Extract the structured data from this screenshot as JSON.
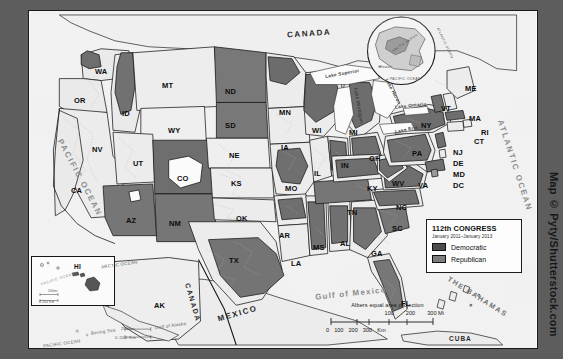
{
  "figure": {
    "watermark": "Map © Pyty/Shutterstock.com",
    "frame_color": "#5d5d5d",
    "background_color": "#fbfbfb"
  },
  "legend": {
    "title": "112th CONGRESS",
    "subtitle": "January 2011–January 2013",
    "entries": [
      {
        "label": "Democratic",
        "color": "#4c4c4c",
        "swatch_name": "democratic-swatch"
      },
      {
        "label": "Republican",
        "color": "#7d7d7d",
        "swatch_name": "republican-swatch"
      }
    ]
  },
  "scalebar": {
    "projection": "Albers equal area projection",
    "miles_ticks": [
      "100",
      "200",
      "300 Mi"
    ],
    "km_ticks": [
      "0",
      "100",
      "200",
      "300",
      "Km"
    ]
  },
  "insets": {
    "hawaii": {
      "state": "HI",
      "ocean": "PACIFIC OCEAN",
      "scale_mi": "200mi",
      "scale_km": "0   200 Km"
    },
    "globe": {
      "labels": [
        "ARCTIC OCEAN",
        "ATLANTIC OCEAN",
        "PACIFIC OCEAN",
        "Hawaii"
      ]
    },
    "alaska": {
      "state": "AK",
      "labels": [
        "ARCTIC OCEAN",
        "Bering Sea",
        "Gulf of Alaska",
        "PACIFIC OCEAN"
      ],
      "scale_mi": "200mi",
      "scale_km": "0   200 Km"
    }
  },
  "countries": [
    {
      "name": "CANADA",
      "x": 258,
      "y": 22
    },
    {
      "name": "MEXICO",
      "x": 196,
      "y": 302
    },
    {
      "name": "CANADA",
      "x": 150,
      "y": 300
    },
    {
      "name": "CUBA",
      "x": 425,
      "y": 330
    },
    {
      "name": "THE BAHAMAS",
      "x": 448,
      "y": 296
    }
  ],
  "oceans": [
    {
      "name": "PACIFIC OCEAN",
      "x": 20,
      "y": 175
    },
    {
      "name": "ATLANTIC OCEAN",
      "x": 452,
      "y": 165
    },
    {
      "name": "Gulf of Mexico",
      "x": 300,
      "y": 282
    }
  ],
  "lakes": [
    {
      "name": "Lake Superior",
      "x": 312,
      "y": 66
    },
    {
      "name": "Lake Michigan",
      "x": 330,
      "y": 108
    },
    {
      "name": "Lake Huron",
      "x": 358,
      "y": 90
    },
    {
      "name": "Lake Erie",
      "x": 376,
      "y": 120
    },
    {
      "name": "Lake Ontario",
      "x": 386,
      "y": 100
    }
  ],
  "chart_data": {
    "type": "map",
    "categories": [
      "Democratic",
      "Republican"
    ],
    "colors": {
      "Democratic": "#4c4c4c",
      "Republican": "#7d7d7d",
      "unshaded": "#e9e9e9"
    },
    "states": [
      {
        "code": "WA",
        "label_x": 66,
        "label_y": 56,
        "party": "mixed"
      },
      {
        "code": "OR",
        "label_x": 45,
        "label_y": 85,
        "party": "mixed"
      },
      {
        "code": "ID",
        "label_x": 93,
        "label_y": 98,
        "party": "Republican"
      },
      {
        "code": "MT",
        "label_x": 133,
        "label_y": 70,
        "party": "mixed"
      },
      {
        "code": "WY",
        "label_x": 139,
        "label_y": 115,
        "party": "mixed"
      },
      {
        "code": "ND",
        "label_x": 196,
        "label_y": 76,
        "party": "Republican"
      },
      {
        "code": "SD",
        "label_x": 196,
        "label_y": 110,
        "party": "Republican"
      },
      {
        "code": "NE",
        "label_x": 200,
        "label_y": 140,
        "party": "mixed"
      },
      {
        "code": "MN",
        "label_x": 250,
        "label_y": 97,
        "party": "mixed"
      },
      {
        "code": "IA",
        "label_x": 252,
        "label_y": 132,
        "party": "mixed"
      },
      {
        "code": "WI",
        "label_x": 283,
        "label_y": 115,
        "party": "mixed"
      },
      {
        "code": "MI",
        "label_x": 320,
        "label_y": 117,
        "party": "mixed"
      },
      {
        "code": "NV",
        "label_x": 63,
        "label_y": 134,
        "party": "mixed"
      },
      {
        "code": "UT",
        "label_x": 104,
        "label_y": 148,
        "party": "mixed"
      },
      {
        "code": "CO",
        "label_x": 148,
        "label_y": 163,
        "party": "Republican"
      },
      {
        "code": "KS",
        "label_x": 202,
        "label_y": 168,
        "party": "mixed"
      },
      {
        "code": "MO",
        "label_x": 256,
        "label_y": 173,
        "party": "mixed"
      },
      {
        "code": "IL",
        "label_x": 285,
        "label_y": 158,
        "party": "mixed"
      },
      {
        "code": "IN",
        "label_x": 312,
        "label_y": 150,
        "party": "mixed"
      },
      {
        "code": "OH",
        "label_x": 340,
        "label_y": 143,
        "party": "mixed"
      },
      {
        "code": "CA",
        "label_x": 42,
        "label_y": 175,
        "party": "mixed"
      },
      {
        "code": "AZ",
        "label_x": 97,
        "label_y": 205,
        "party": "Republican"
      },
      {
        "code": "NM",
        "label_x": 140,
        "label_y": 208,
        "party": "Republican"
      },
      {
        "code": "OK",
        "label_x": 207,
        "label_y": 203,
        "party": "mixed"
      },
      {
        "code": "AR",
        "label_x": 250,
        "label_y": 220,
        "party": "mixed"
      },
      {
        "code": "TX",
        "label_x": 200,
        "label_y": 245,
        "party": "mixed"
      },
      {
        "code": "LA",
        "label_x": 262,
        "label_y": 248,
        "party": "mixed"
      },
      {
        "code": "MS",
        "label_x": 284,
        "label_y": 232,
        "party": "mixed"
      },
      {
        "code": "AL",
        "label_x": 311,
        "label_y": 228,
        "party": "mixed"
      },
      {
        "code": "TN",
        "label_x": 318,
        "label_y": 197,
        "party": "Republican"
      },
      {
        "code": "KY",
        "label_x": 338,
        "label_y": 173,
        "party": "mixed"
      },
      {
        "code": "GA",
        "label_x": 342,
        "label_y": 238,
        "party": "mixed"
      },
      {
        "code": "FL",
        "label_x": 372,
        "label_y": 288,
        "party": "mixed"
      },
      {
        "code": "SC",
        "label_x": 363,
        "label_y": 213,
        "party": "Republican"
      },
      {
        "code": "NC",
        "label_x": 367,
        "label_y": 192,
        "party": "mixed"
      },
      {
        "code": "VA",
        "label_x": 389,
        "label_y": 170,
        "party": "mixed"
      },
      {
        "code": "WV",
        "label_x": 363,
        "label_y": 168,
        "party": "mixed"
      },
      {
        "code": "PA",
        "label_x": 383,
        "label_y": 138,
        "party": "mixed"
      },
      {
        "code": "NY",
        "label_x": 392,
        "label_y": 110,
        "party": "mixed"
      },
      {
        "code": "VT",
        "label_x": 412,
        "label_y": 93,
        "party": "mixed"
      },
      {
        "code": "ME",
        "label_x": 436,
        "label_y": 73,
        "party": "mixed"
      },
      {
        "code": "MA",
        "label_x": 440,
        "label_y": 103,
        "party": "mixed"
      },
      {
        "code": "RI",
        "label_x": 452,
        "label_y": 117,
        "party": "mixed"
      },
      {
        "code": "CT",
        "label_x": 445,
        "label_y": 126,
        "party": "mixed"
      },
      {
        "code": "NJ",
        "label_x": 424,
        "label_y": 137,
        "party": "mixed"
      },
      {
        "code": "DE",
        "label_x": 424,
        "label_y": 148,
        "party": "mixed"
      },
      {
        "code": "MD",
        "label_x": 424,
        "label_y": 159,
        "party": "mixed"
      },
      {
        "code": "DC",
        "label_x": 424,
        "label_y": 170,
        "party": "mixed"
      },
      {
        "code": "AK",
        "label_x": 125,
        "label_y": 290,
        "party": "mixed"
      },
      {
        "code": "HI",
        "label_x": 50,
        "label_y": 257,
        "party": "mixed"
      }
    ]
  }
}
